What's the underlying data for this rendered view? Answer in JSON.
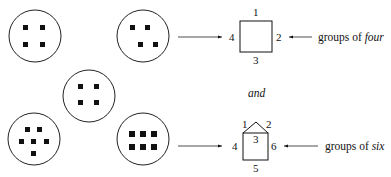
{
  "diagram": {
    "groups": [
      {
        "id": "group-1",
        "count": 4,
        "arrangement": "square"
      },
      {
        "id": "group-2",
        "count": 4,
        "arrangement": "offset"
      },
      {
        "id": "group-3",
        "count": 4,
        "arrangement": "square"
      },
      {
        "id": "group-4",
        "count": 6,
        "arrangement": "cross"
      },
      {
        "id": "group-5",
        "count": 6,
        "arrangement": "grid-2x3"
      }
    ],
    "square": {
      "labels": [
        "1",
        "2",
        "3",
        "4"
      ],
      "caption_prefix": "groups of ",
      "caption_emph": "four"
    },
    "connector": "and",
    "house": {
      "labels": [
        "1",
        "2",
        "3",
        "4",
        "5",
        "6"
      ],
      "caption_prefix": "groups of ",
      "caption_emph": "six"
    }
  }
}
